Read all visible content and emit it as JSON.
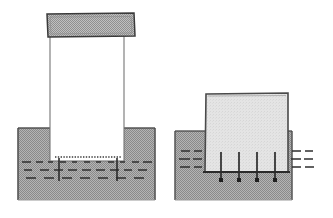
{
  "document": {
    "title": "Geotechnical cross-section comparison",
    "background_color": "#ffffff",
    "width": 333,
    "height": 218
  },
  "palette": {
    "soil_fill": "#a8a8a8",
    "soil_hatch_dark": "#6e6e6e",
    "cap_fill": "#b0b0b0",
    "block_fill": "#e2e2e2",
    "column_fill": "#ffffff",
    "outline": "#3a3a3a",
    "outline_soft": "#808080",
    "dash_color": "#2f2f2f"
  },
  "figures": [
    {
      "id": "left-figure",
      "name": "deep-penetration-caisson",
      "soil_block": {
        "name": "soil-mass-left",
        "x": 18,
        "y": 128,
        "width": 137,
        "height": 72,
        "fill": "#a8a8a8",
        "pattern": "checker-hatch"
      },
      "column": {
        "name": "caisson-shaft",
        "x": 50,
        "y": 24,
        "width": 74,
        "height": 137,
        "fill": "#ffffff",
        "stroke": "#707070"
      },
      "cap": {
        "name": "caisson-top-cap",
        "x": 47,
        "y": 13,
        "width": 88,
        "height": 25,
        "fill": "#b0b0b0",
        "pattern": "checker-hatch",
        "stroke": "#3a3a3a"
      },
      "base_dotted_line": {
        "name": "caisson-base-dotted-line",
        "x1": 55,
        "x2": 122,
        "y": 157,
        "style": "fine-dotted"
      },
      "dash_rows": [
        {
          "name": "strata-dash-row-1",
          "y": 162,
          "segments": [
            [
              22,
              9
            ],
            [
              36,
              7
            ],
            [
              48,
              5
            ],
            [
              60,
              6
            ],
            [
              72,
              5
            ],
            [
              84,
              6
            ],
            [
              96,
              5
            ],
            [
              108,
              6
            ],
            [
              120,
              5
            ],
            [
              132,
              7
            ],
            [
              143,
              9
            ]
          ]
        },
        {
          "name": "strata-dash-row-2",
          "y": 170,
          "segments": [
            [
              24,
              8
            ],
            [
              40,
              9
            ],
            [
              54,
              9
            ],
            [
              68,
              9
            ],
            [
              82,
              9
            ],
            [
              96,
              9
            ],
            [
              110,
              9
            ],
            [
              124,
              8
            ],
            [
              138,
              9
            ]
          ]
        },
        {
          "name": "strata-dash-row-3",
          "y": 178,
          "segments": [
            [
              26,
              10
            ],
            [
              44,
              10
            ],
            [
              62,
              10
            ],
            [
              80,
              10
            ],
            [
              98,
              10
            ],
            [
              116,
              10
            ],
            [
              134,
              10
            ]
          ]
        }
      ],
      "stakes": [
        {
          "name": "stake-left",
          "x": 59,
          "y1": 158,
          "y2": 180
        },
        {
          "name": "stake-right",
          "x": 117,
          "y1": 158,
          "y2": 180
        }
      ]
    },
    {
      "id": "right-figure",
      "name": "shallow-footing-with-anchors",
      "soil_block": {
        "name": "soil-mass-right",
        "x": 175,
        "y": 131,
        "width": 117,
        "height": 69,
        "fill": "#a8a8a8",
        "pattern": "checker-hatch"
      },
      "block": {
        "name": "footing-block",
        "x": 205,
        "y": 93,
        "width": 83,
        "height": 79,
        "fill": "#e2e2e2",
        "stroke": "#4a4a4a"
      },
      "dash_rows_left": [
        {
          "name": "left-strata-dash-1",
          "y": 151,
          "segments": [
            [
              181,
              9
            ],
            [
              194,
              8
            ]
          ]
        },
        {
          "name": "left-strata-dash-2",
          "y": 159,
          "segments": [
            [
              179,
              11
            ],
            [
              193,
              9
            ]
          ]
        },
        {
          "name": "left-strata-dash-3",
          "y": 167,
          "segments": [
            [
              180,
              10
            ],
            [
              194,
              8
            ]
          ]
        }
      ],
      "dash_rows_right": [
        {
          "name": "right-strata-dash-1",
          "y": 151,
          "segments": [
            [
              292,
              9
            ],
            [
              305,
              8
            ]
          ]
        },
        {
          "name": "right-strata-dash-2",
          "y": 159,
          "segments": [
            [
              291,
              10
            ],
            [
              304,
              9
            ]
          ]
        },
        {
          "name": "right-strata-dash-3",
          "y": 167,
          "segments": [
            [
              292,
              9
            ],
            [
              305,
              9
            ]
          ]
        }
      ],
      "anchor_pins": [
        {
          "name": "anchor-pin-1",
          "x": 221,
          "y_top": 152,
          "y_bottom": 180
        },
        {
          "name": "anchor-pin-2",
          "x": 239,
          "y_top": 152,
          "y_bottom": 180
        },
        {
          "name": "anchor-pin-3",
          "x": 257,
          "y_top": 152,
          "y_bottom": 180
        },
        {
          "name": "anchor-pin-4",
          "x": 275,
          "y_top": 152,
          "y_bottom": 180
        }
      ],
      "base_line": {
        "name": "footing-base-line",
        "x1": 203,
        "x2": 290,
        "y": 172
      }
    }
  ]
}
